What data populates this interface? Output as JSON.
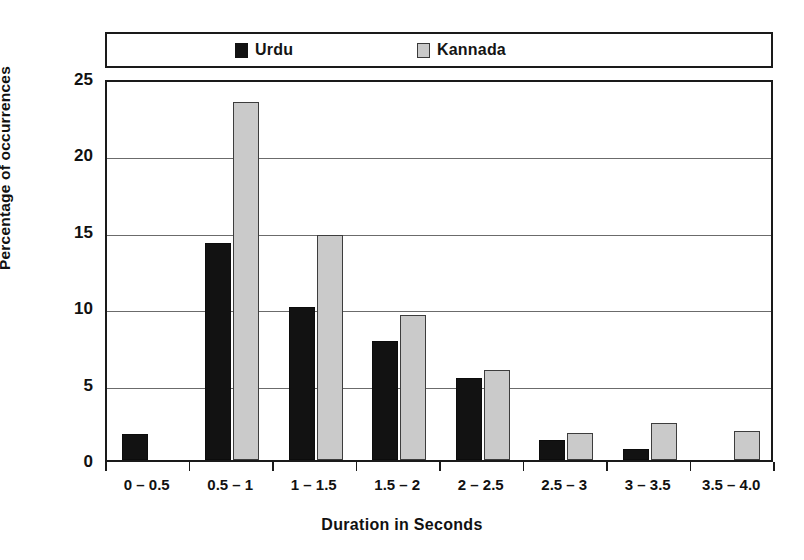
{
  "chart_data": {
    "type": "bar",
    "title": "",
    "xlabel": "Duration in Seconds",
    "ylabel": "Percentage of occurrences",
    "categories": [
      "0 – 0.5",
      "0.5 – 1",
      "1 – 1.5",
      "1.5 – 2",
      "2 – 2.5",
      "2.5 – 3",
      "3 – 3.5",
      "3.5 – 4.0"
    ],
    "series": [
      {
        "name": "Urdu",
        "color": "#121212",
        "values": [
          1.7,
          14.2,
          10.0,
          7.8,
          5.4,
          1.3,
          0.7,
          0
        ]
      },
      {
        "name": "Kannada",
        "color": "#cacaca",
        "values": [
          0,
          23.4,
          14.7,
          9.5,
          5.9,
          1.8,
          2.4,
          1.9
        ]
      }
    ],
    "ylim": [
      0,
      25
    ],
    "yticks": [
      0,
      5,
      10,
      15,
      20,
      25
    ],
    "ytick_labels": [
      "0",
      "5",
      "10",
      "15",
      "20",
      "25"
    ],
    "grid": true,
    "legend_position": "top"
  },
  "legend": {
    "entries": [
      {
        "label": "Urdu",
        "swatch": "filled-black-square"
      },
      {
        "label": "Kannada",
        "swatch": "outlined-gray-square"
      }
    ]
  }
}
